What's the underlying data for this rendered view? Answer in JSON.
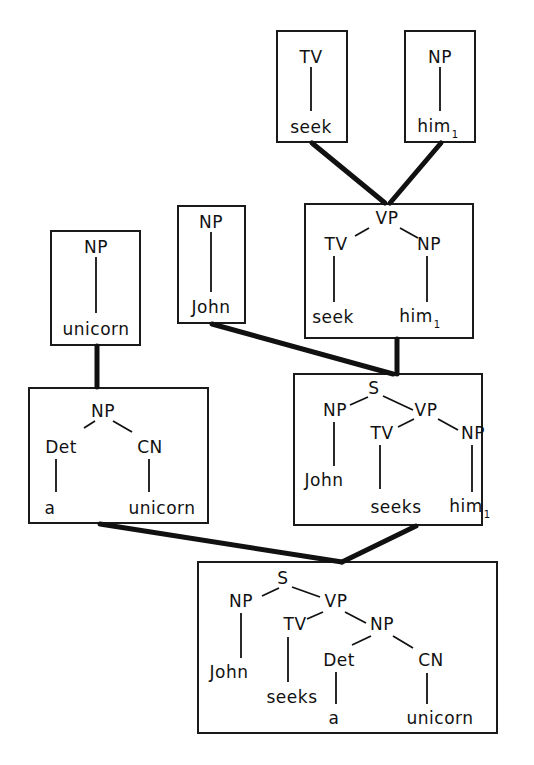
{
  "caption_fragment": "",
  "boxes": [
    {
      "id": "tv-seek",
      "x": 276,
      "y": 30,
      "w": 72,
      "h": 113
    },
    {
      "id": "np-him",
      "x": 404,
      "y": 30,
      "w": 72,
      "h": 113
    },
    {
      "id": "vp",
      "x": 304,
      "y": 203,
      "w": 170,
      "h": 136
    },
    {
      "id": "np-john",
      "x": 177,
      "y": 205,
      "w": 69,
      "h": 119
    },
    {
      "id": "np-unicorn",
      "x": 50,
      "y": 230,
      "w": 91,
      "h": 116
    },
    {
      "id": "np-det-cn",
      "x": 28,
      "y": 387,
      "w": 181,
      "h": 137
    },
    {
      "id": "s-him",
      "x": 293,
      "y": 373,
      "w": 190,
      "h": 153
    },
    {
      "id": "s-final",
      "x": 197,
      "y": 561,
      "w": 301,
      "h": 173
    }
  ],
  "labels": [
    {
      "box": "tv-seek",
      "text": "TV",
      "sub": "",
      "x": 311,
      "y": 57
    },
    {
      "box": "tv-seek",
      "text": "seek",
      "sub": "",
      "x": 311,
      "y": 127
    },
    {
      "box": "np-him",
      "text": "NP",
      "sub": "",
      "x": 440,
      "y": 57
    },
    {
      "box": "np-him",
      "text": "him",
      "sub": "1",
      "x": 438,
      "y": 127
    },
    {
      "box": "vp",
      "text": "VP",
      "sub": "",
      "x": 387,
      "y": 218
    },
    {
      "box": "vp",
      "text": "TV",
      "sub": "",
      "x": 336,
      "y": 244
    },
    {
      "box": "vp",
      "text": "NP",
      "sub": "",
      "x": 429,
      "y": 244
    },
    {
      "box": "vp",
      "text": "seek",
      "sub": "",
      "x": 333,
      "y": 317
    },
    {
      "box": "vp",
      "text": "him",
      "sub": "1",
      "x": 420,
      "y": 317
    },
    {
      "box": "np-john",
      "text": "NP",
      "sub": "",
      "x": 211,
      "y": 222
    },
    {
      "box": "np-john",
      "text": "John",
      "sub": "",
      "x": 211,
      "y": 307
    },
    {
      "box": "np-unicorn",
      "text": "NP",
      "sub": "",
      "x": 96,
      "y": 247
    },
    {
      "box": "np-unicorn",
      "text": "unicorn",
      "sub": "",
      "x": 96,
      "y": 329
    },
    {
      "box": "np-det-cn",
      "text": "NP",
      "sub": "",
      "x": 103,
      "y": 411
    },
    {
      "box": "np-det-cn",
      "text": "Det",
      "sub": "",
      "x": 61,
      "y": 447
    },
    {
      "box": "np-det-cn",
      "text": "CN",
      "sub": "",
      "x": 150,
      "y": 447
    },
    {
      "box": "np-det-cn",
      "text": "a",
      "sub": "",
      "x": 50,
      "y": 508
    },
    {
      "box": "np-det-cn",
      "text": "unicorn",
      "sub": "",
      "x": 162,
      "y": 508
    },
    {
      "box": "s-him",
      "text": "S",
      "sub": "",
      "x": 374,
      "y": 388
    },
    {
      "box": "s-him",
      "text": "NP",
      "sub": "",
      "x": 335,
      "y": 410
    },
    {
      "box": "s-him",
      "text": "VP",
      "sub": "",
      "x": 426,
      "y": 410
    },
    {
      "box": "s-him",
      "text": "TV",
      "sub": "",
      "x": 382,
      "y": 433
    },
    {
      "box": "s-him",
      "text": "NP",
      "sub": "",
      "x": 473,
      "y": 433
    },
    {
      "box": "s-him",
      "text": "John",
      "sub": "",
      "x": 324,
      "y": 480
    },
    {
      "box": "s-him",
      "text": "seeks",
      "sub": "",
      "x": 396,
      "y": 507
    },
    {
      "box": "s-him",
      "text": "him",
      "sub": "1",
      "x": 470,
      "y": 507
    },
    {
      "box": "s-final",
      "text": "S",
      "sub": "",
      "x": 283,
      "y": 578
    },
    {
      "box": "s-final",
      "text": "NP",
      "sub": "",
      "x": 241,
      "y": 601
    },
    {
      "box": "s-final",
      "text": "VP",
      "sub": "",
      "x": 336,
      "y": 601
    },
    {
      "box": "s-final",
      "text": "TV",
      "sub": "",
      "x": 295,
      "y": 624
    },
    {
      "box": "s-final",
      "text": "NP",
      "sub": "",
      "x": 382,
      "y": 624
    },
    {
      "box": "s-final",
      "text": "Det",
      "sub": "",
      "x": 339,
      "y": 660
    },
    {
      "box": "s-final",
      "text": "CN",
      "sub": "",
      "x": 431,
      "y": 660
    },
    {
      "box": "s-final",
      "text": "John",
      "sub": "",
      "x": 229,
      "y": 672
    },
    {
      "box": "s-final",
      "text": "seeks",
      "sub": "",
      "x": 292,
      "y": 697
    },
    {
      "box": "s-final",
      "text": "a",
      "sub": "",
      "x": 334,
      "y": 718
    },
    {
      "box": "s-final",
      "text": "unicorn",
      "sub": "",
      "x": 440,
      "y": 718
    }
  ],
  "tree_edges": [
    [
      311,
      67,
      311,
      111
    ],
    [
      440,
      67,
      440,
      111
    ],
    [
      369,
      228,
      355,
      236
    ],
    [
      400,
      228,
      418,
      238
    ],
    [
      334,
      256,
      334,
      302
    ],
    [
      427,
      256,
      427,
      302
    ],
    [
      211,
      232,
      211,
      292
    ],
    [
      96,
      257,
      96,
      313
    ],
    [
      95,
      421,
      84,
      428
    ],
    [
      113,
      421,
      132,
      432
    ],
    [
      56,
      459,
      56,
      492
    ],
    [
      149,
      459,
      149,
      492
    ],
    [
      368,
      397,
      350,
      405
    ],
    [
      383,
      396,
      413,
      410
    ],
    [
      414,
      419,
      398,
      427
    ],
    [
      438,
      419,
      458,
      430
    ],
    [
      334,
      422,
      334,
      466
    ],
    [
      380,
      445,
      380,
      489
    ],
    [
      472,
      445,
      472,
      492
    ],
    [
      279,
      588,
      262,
      596
    ],
    [
      292,
      587,
      320,
      597
    ],
    [
      323,
      612,
      307,
      619
    ],
    [
      345,
      612,
      366,
      623
    ],
    [
      371,
      636,
      352,
      645
    ],
    [
      393,
      636,
      413,
      648
    ],
    [
      241,
      613,
      241,
      658
    ],
    [
      288,
      637,
      288,
      682
    ],
    [
      336,
      672,
      336,
      704
    ],
    [
      427,
      673,
      427,
      704
    ]
  ],
  "connectors": [
    {
      "from": "tv-seek",
      "to": "vp",
      "line": [
        312,
        143,
        385,
        203
      ]
    },
    {
      "from": "np-him",
      "to": "vp",
      "line": [
        441,
        143,
        390,
        203
      ]
    },
    {
      "from": "np-john",
      "to": "s-him",
      "line": [
        212,
        324,
        393,
        374
      ]
    },
    {
      "from": "vp",
      "to": "s-him",
      "line": [
        397,
        339,
        397,
        374
      ]
    },
    {
      "from": "np-unicorn",
      "to": "np-det-cn",
      "line": [
        97,
        346,
        97,
        387
      ]
    },
    {
      "from": "np-det-cn",
      "to": "s-final",
      "line": [
        100,
        524,
        342,
        562
      ]
    },
    {
      "from": "s-him",
      "to": "s-final",
      "line": [
        416,
        526,
        342,
        562
      ]
    }
  ]
}
